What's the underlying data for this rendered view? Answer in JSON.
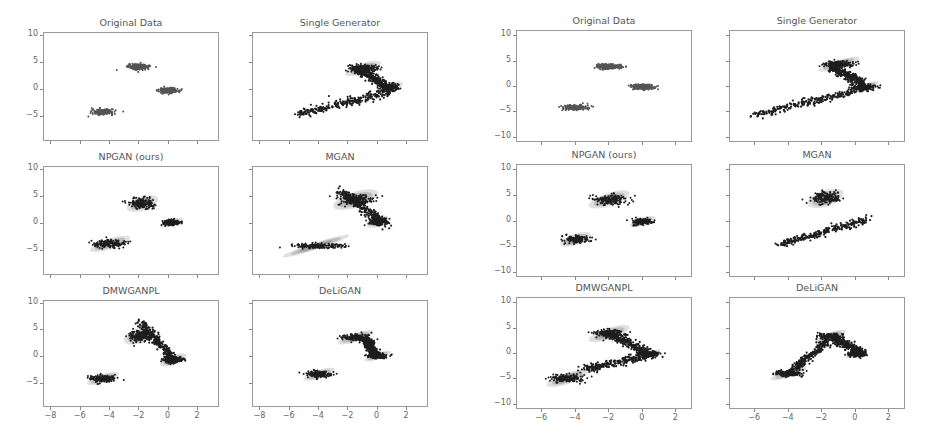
{
  "figure": {
    "grids": [
      {
        "id": "left",
        "panels": [
          {
            "title": "Original Data"
          },
          {
            "title": "Single Generator"
          },
          {
            "title": "NPGAN (ours)"
          },
          {
            "title": "MGAN"
          },
          {
            "title": "DMWGANPL"
          },
          {
            "title": "DeLiGAN"
          }
        ],
        "yticks": [
          "10",
          "5",
          "0",
          "−5"
        ],
        "xticks": [
          "−8",
          "−6",
          "−4",
          "−2",
          "0",
          "2"
        ]
      },
      {
        "id": "right",
        "panels": [
          {
            "title": "Original Data"
          },
          {
            "title": "Single Generator"
          },
          {
            "title": "NPGAN (ours)"
          },
          {
            "title": "MGAN"
          },
          {
            "title": "DMWGANPL"
          },
          {
            "title": "DeLiGAN"
          }
        ],
        "yticks": [
          "10",
          "5",
          "0",
          "−5",
          "−10"
        ],
        "xticks": [
          "−6",
          "−4",
          "−2",
          "0",
          "2"
        ]
      }
    ],
    "colors": {
      "points": "#1e1e1e",
      "density": "#6e6e6e",
      "frame": "#9a9a9a",
      "text": "#555555"
    }
  },
  "chart_data": [
    {
      "type": "scatter",
      "grid": "left",
      "xlim": [
        -8.5,
        3.5
      ],
      "ylim": [
        -9.5,
        10.5
      ],
      "xticks": [
        -8,
        -6,
        -4,
        -2,
        0,
        2
      ],
      "yticks": [
        10,
        5,
        0,
        -5
      ],
      "grid_lines": false,
      "panels": [
        {
          "title": "Original Data",
          "clusters": [
            {
              "x": -4.5,
              "y": -4,
              "sx": 0.6,
              "sy": 0.4
            },
            {
              "x": -2,
              "y": 4.3,
              "sx": 0.6,
              "sy": 0.4
            },
            {
              "x": 0,
              "y": 0,
              "sx": 0.55,
              "sy": 0.4
            }
          ]
        },
        {
          "title": "Single Generator",
          "clusters": [
            {
              "x": -1,
              "y": 4,
              "sx": 0.8,
              "sy": 0.6
            },
            {
              "x": 0.8,
              "y": 0.5,
              "sx": 0.6,
              "sy": 0.5
            }
          ],
          "bridges": [
            [
              [
                -5.5,
                -4.5
              ],
              [
                1.2,
                0
              ]
            ],
            [
              [
                -1.5,
                4
              ],
              [
                0.5,
                1
              ]
            ]
          ]
        },
        {
          "title": "NPGAN (ours)",
          "clusters": [
            {
              "x": -4,
              "y": -3.6,
              "sx": 0.9,
              "sy": 0.6
            },
            {
              "x": -1.8,
              "y": 3.8,
              "sx": 0.7,
              "sy": 0.8
            },
            {
              "x": 0.2,
              "y": 0.3,
              "sx": 0.5,
              "sy": 0.4
            }
          ]
        },
        {
          "title": "MGAN",
          "clusters": [
            {
              "x": -4.2,
              "y": -4,
              "sx": 1.5,
              "sy": 0.4
            },
            {
              "x": -1.5,
              "y": 4.5,
              "sx": 1.0,
              "sy": 0.9
            },
            {
              "x": 0,
              "y": 0.5,
              "sx": 0.5,
              "sy": 0.6
            }
          ],
          "bridges": [
            [
              [
                -2.5,
                6
              ],
              [
                0.5,
                0
              ]
            ]
          ]
        },
        {
          "title": "DMWGANPL",
          "clusters": [
            {
              "x": -4.5,
              "y": -4,
              "sx": 0.7,
              "sy": 0.5
            },
            {
              "x": -2,
              "y": 4,
              "sx": 0.7,
              "sy": 0.9
            },
            {
              "x": 0.3,
              "y": -0.5,
              "sx": 0.6,
              "sy": 0.6
            }
          ],
          "bridges": [
            [
              [
                -2,
                6.5
              ],
              [
                0.3,
                0
              ]
            ]
          ]
        },
        {
          "title": "DeLiGAN",
          "clusters": [
            {
              "x": -4,
              "y": -3.2,
              "sx": 0.7,
              "sy": 0.5
            },
            {
              "x": -1.5,
              "y": 3.7,
              "sx": 0.8,
              "sy": 0.5
            },
            {
              "x": 0,
              "y": 0.2,
              "sx": 0.6,
              "sy": 0.4
            }
          ],
          "bridges": [
            [
              [
                -0.8,
                3.5
              ],
              [
                -0.2,
                0.5
              ]
            ]
          ]
        }
      ]
    },
    {
      "type": "scatter",
      "grid": "right",
      "xlim": [
        -7.5,
        3
      ],
      "ylim": [
        -11,
        11
      ],
      "xticks": [
        -6,
        -4,
        -2,
        0,
        2
      ],
      "yticks": [
        10,
        5,
        0,
        -5,
        -10
      ],
      "grid_lines": false,
      "panels": [
        {
          "title": "Original Data",
          "clusters": [
            {
              "x": -4,
              "y": -4,
              "sx": 0.6,
              "sy": 0.4
            },
            {
              "x": -2,
              "y": 4,
              "sx": 0.6,
              "sy": 0.4
            },
            {
              "x": 0,
              "y": 0,
              "sx": 0.5,
              "sy": 0.4
            }
          ]
        },
        {
          "title": "Single Generator",
          "clusters": [
            {
              "x": -1,
              "y": 4.5,
              "sx": 0.8,
              "sy": 0.5
            },
            {
              "x": 0.5,
              "y": 0,
              "sx": 0.6,
              "sy": 0.4
            }
          ],
          "bridges": [
            [
              [
                -6,
                -5.5
              ],
              [
                1,
                0
              ]
            ],
            [
              [
                -1.5,
                4
              ],
              [
                0.5,
                0.5
              ]
            ]
          ]
        },
        {
          "title": "NPGAN (ours)",
          "clusters": [
            {
              "x": -4,
              "y": -3.5,
              "sx": 0.6,
              "sy": 0.7
            },
            {
              "x": -2,
              "y": 4.3,
              "sx": 0.8,
              "sy": 0.8
            },
            {
              "x": 0,
              "y": 0,
              "sx": 0.5,
              "sy": 0.5
            }
          ]
        },
        {
          "title": "MGAN",
          "clusters": [
            {
              "x": -1.8,
              "y": 4.5,
              "sx": 0.7,
              "sy": 1.0
            }
          ],
          "bridges": [
            [
              [
                -4.5,
                -4.5
              ],
              [
                0.8,
                0.5
              ]
            ]
          ]
        },
        {
          "title": "DMWGANPL",
          "clusters": [
            {
              "x": -4.5,
              "y": -4.8,
              "sx": 0.8,
              "sy": 0.7
            },
            {
              "x": -2,
              "y": 4,
              "sx": 0.8,
              "sy": 0.7
            },
            {
              "x": 0.3,
              "y": 0,
              "sx": 0.5,
              "sy": 0.3
            }
          ],
          "bridges": [
            [
              [
                -3.5,
                -3
              ],
              [
                0.8,
                0
              ]
            ],
            [
              [
                -2,
                4
              ],
              [
                0.5,
                0
              ]
            ]
          ]
        },
        {
          "title": "DeLiGAN",
          "clusters": [
            {
              "x": -4,
              "y": -3.8,
              "sx": 0.7,
              "sy": 0.5
            },
            {
              "x": -1.5,
              "y": 3.5,
              "sx": 0.6,
              "sy": 0.5
            },
            {
              "x": 0,
              "y": 0,
              "sx": 0.4,
              "sy": 0.4
            }
          ],
          "bridges": [
            [
              [
                -4,
                -3.8
              ],
              [
                -1.5,
                3
              ]
            ],
            [
              [
                -1.3,
                3
              ],
              [
                0.5,
                0
              ]
            ]
          ]
        }
      ]
    }
  ]
}
